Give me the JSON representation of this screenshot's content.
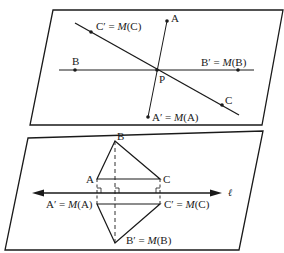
{
  "figure": {
    "top_panel": {
      "description": "Reflection across point P (half-turn) — plane with three lines through P",
      "points": {
        "A": {
          "label": "A"
        },
        "A_prime": {
          "label": "A′ = M(A)",
          "prefix": "A′ = ",
          "func": "M",
          "arg": "(A)"
        },
        "B": {
          "label": "B"
        },
        "B_prime": {
          "label": "B′ = M(B)",
          "prefix": "B′ = ",
          "func": "M",
          "arg": "(B)"
        },
        "C": {
          "label": "C"
        },
        "C_prime": {
          "label": "C′ = M(C)",
          "prefix": "C′ = ",
          "func": "M",
          "arg": "(C)"
        },
        "P": {
          "label": "P"
        }
      }
    },
    "bottom_panel": {
      "description": "Reflection of triangle ABC across line ℓ",
      "line_label": "ℓ",
      "points": {
        "A": {
          "label": "A"
        },
        "B": {
          "label": "B"
        },
        "C": {
          "label": "C"
        },
        "A_prime": {
          "label": "A′ = M(A)",
          "prefix": "A′ = ",
          "func": "M",
          "arg": "(A)"
        },
        "B_prime": {
          "label": "B′ = M(B)",
          "prefix": "B′ = ",
          "func": "M",
          "arg": "(B)"
        },
        "C_prime": {
          "label": "C′ = M(C)",
          "prefix": "C′ = ",
          "func": "M",
          "arg": "(C)"
        }
      }
    },
    "colors": {
      "ink": "#1a1a1a",
      "background": "#ffffff"
    }
  }
}
